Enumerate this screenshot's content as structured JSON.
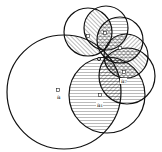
{
  "diagram": {
    "common_point": {
      "x": 99,
      "y": 59
    },
    "colors": {
      "stroke": "#111111",
      "hatch": "#333333",
      "background": "#ffffff"
    },
    "circles": [
      {
        "id": "big",
        "cx": 64,
        "cy": 92,
        "r": 57
      },
      {
        "id": "lower",
        "cx": 107,
        "cy": 95,
        "r": 38
      },
      {
        "id": "top-left",
        "cx": 88,
        "cy": 32,
        "r": 24
      },
      {
        "id": "top",
        "cx": 106,
        "cy": 28,
        "r": 22
      },
      {
        "id": "top-right",
        "cx": 120,
        "cy": 40,
        "r": 23
      },
      {
        "id": "right-upper",
        "cx": 126,
        "cy": 56,
        "r": 22
      },
      {
        "id": "right",
        "cx": 127,
        "cy": 76,
        "r": 28
      }
    ],
    "labels": [
      {
        "text": "a",
        "x": 57,
        "y": 99
      },
      {
        "text": "a₁",
        "x": 97,
        "y": 107
      },
      {
        "text": "a₇",
        "x": 121,
        "y": 83
      }
    ],
    "markers": [
      {
        "x": 58,
        "y": 90
      },
      {
        "x": 88,
        "y": 36
      },
      {
        "x": 105,
        "y": 33
      },
      {
        "x": 120,
        "y": 48
      },
      {
        "x": 124,
        "y": 72
      },
      {
        "x": 100,
        "y": 95
      }
    ]
  }
}
